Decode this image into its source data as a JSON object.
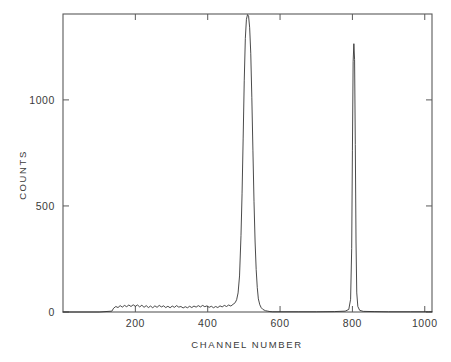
{
  "chart_data": {
    "type": "line",
    "title": "",
    "xlabel": "CHANNEL NUMBER",
    "ylabel": "COUNTS",
    "xlim": [
      0,
      1020
    ],
    "ylim": [
      0,
      1405
    ],
    "grid": false,
    "legend": null,
    "x_ticks": [
      200,
      400,
      600,
      800,
      1000
    ],
    "x_tick_labels": [
      "200",
      "400",
      "600",
      "800",
      "1000"
    ],
    "y_ticks": [
      0,
      500,
      1000
    ],
    "y_tick_labels": [
      "0",
      "500",
      "1000"
    ],
    "line_color": "#2b2b2b",
    "axis_color": "#5a5a5a",
    "background_color": "#ffffff",
    "annotations": [],
    "features": [
      {
        "name": "background-plateau",
        "channel_start": 140,
        "channel_end": 480,
        "counts": 22
      },
      {
        "name": "main-peak",
        "center_channel": 517,
        "peak_counts": 1400,
        "fwhm_channels": 22,
        "clipped_at_top": true
      },
      {
        "name": "narrow-peak",
        "center_channel": 805,
        "peak_counts": 1265,
        "fwhm_channels": 4,
        "clipped_at_top": false
      }
    ],
    "x": [
      0,
      100,
      135,
      140,
      146,
      152,
      158,
      164,
      170,
      176,
      182,
      188,
      194,
      200,
      206,
      212,
      218,
      224,
      230,
      236,
      242,
      248,
      254,
      260,
      266,
      272,
      278,
      284,
      290,
      296,
      302,
      308,
      314,
      320,
      326,
      332,
      338,
      344,
      350,
      356,
      362,
      368,
      374,
      380,
      386,
      392,
      398,
      404,
      410,
      416,
      422,
      428,
      434,
      440,
      446,
      452,
      458,
      464,
      470,
      476,
      480,
      484,
      488,
      492,
      495,
      498,
      501,
      504,
      507,
      510,
      513,
      516,
      519,
      522,
      525,
      528,
      531,
      534,
      537,
      540,
      544,
      548,
      552,
      556,
      560,
      566,
      572,
      580,
      600,
      650,
      700,
      750,
      780,
      790,
      795,
      798,
      800,
      802,
      804,
      806,
      808,
      810,
      812,
      815,
      820,
      830,
      860,
      900,
      960,
      1010,
      1020
    ],
    "y": [
      0,
      0,
      4,
      18,
      26,
      21,
      30,
      23,
      31,
      25,
      33,
      26,
      34,
      27,
      33,
      24,
      32,
      22,
      30,
      21,
      28,
      20,
      29,
      22,
      31,
      24,
      29,
      21,
      27,
      20,
      28,
      22,
      30,
      23,
      26,
      19,
      25,
      20,
      27,
      21,
      28,
      23,
      30,
      24,
      31,
      25,
      29,
      22,
      27,
      20,
      26,
      21,
      29,
      24,
      31,
      26,
      33,
      28,
      36,
      44,
      58,
      90,
      170,
      360,
      560,
      820,
      1090,
      1290,
      1380,
      1402,
      1395,
      1340,
      1220,
      1010,
      760,
      520,
      330,
      200,
      115,
      62,
      34,
      20,
      13,
      9,
      6,
      4,
      2,
      1,
      1,
      1,
      1,
      2,
      4,
      12,
      60,
      300,
      760,
      1180,
      1265,
      1190,
      790,
      330,
      90,
      26,
      8,
      3,
      2,
      1,
      1,
      1,
      1,
      1
    ]
  },
  "axes": {
    "x_title": "CHANNEL NUMBER",
    "y_title": "COUNTS"
  }
}
